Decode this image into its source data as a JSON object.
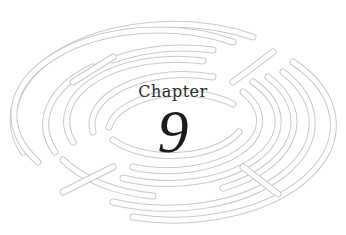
{
  "chapter": {
    "label": "Chapter",
    "number": "9"
  },
  "decoration": {
    "type": "labyrinth-ellipse",
    "line_color": "#cfcfcf",
    "fill_color": "#ffffff"
  }
}
